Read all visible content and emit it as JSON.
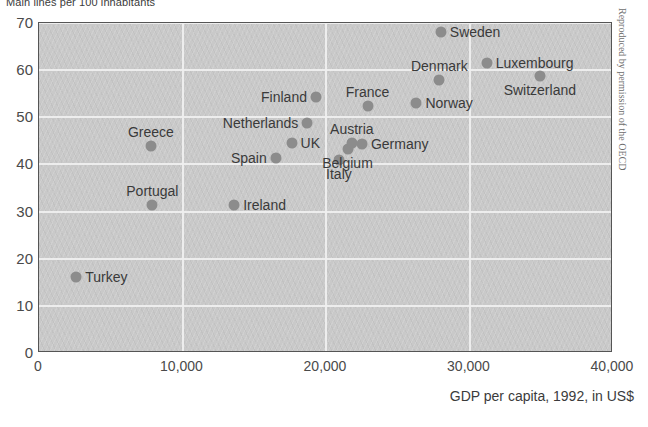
{
  "chart_data": {
    "type": "scatter",
    "title": "Main lines per 100 inhabitants",
    "xlabel": "GDP per capita, 1992, in US$",
    "ylabel": "Main lines per 100 inhabitants",
    "xlim": [
      0,
      40000
    ],
    "ylim": [
      0,
      70
    ],
    "xticks": [
      "0",
      "10,000",
      "20,000",
      "30,000",
      "40,000"
    ],
    "xtick_values": [
      0,
      10000,
      20000,
      30000,
      40000
    ],
    "yticks": [
      "0",
      "10",
      "20",
      "30",
      "40",
      "50",
      "60",
      "70"
    ],
    "ytick_values": [
      0,
      10,
      20,
      30,
      40,
      50,
      60,
      70
    ],
    "grid": true,
    "legend": null,
    "marker_color": "#8c8c8c",
    "plot_background": "#c9c9c9",
    "points": [
      {
        "name": "Turkey",
        "x": 2600,
        "y": 16.2,
        "label_pos": "r"
      },
      {
        "name": "Portugal",
        "x": 7900,
        "y": 31.5,
        "label_pos": "above"
      },
      {
        "name": "Greece",
        "x": 7800,
        "y": 44.0,
        "label_pos": "above"
      },
      {
        "name": "Ireland",
        "x": 13600,
        "y": 31.5,
        "label_pos": "r"
      },
      {
        "name": "Spain",
        "x": 16500,
        "y": 41.3,
        "label_pos": "l"
      },
      {
        "name": "UK",
        "x": 17600,
        "y": 44.5,
        "label_pos": "r"
      },
      {
        "name": "Netherlands",
        "x": 18700,
        "y": 48.8,
        "label_pos": "l"
      },
      {
        "name": "Finland",
        "x": 19300,
        "y": 54.2,
        "label_pos": "l"
      },
      {
        "name": "Italy",
        "x": 20900,
        "y": 41.0,
        "label_pos": "below"
      },
      {
        "name": "Belgium",
        "x": 21500,
        "y": 43.2,
        "label_pos": "below"
      },
      {
        "name": "Austria",
        "x": 21800,
        "y": 44.5,
        "label_pos": "above"
      },
      {
        "name": "France",
        "x": 22900,
        "y": 52.5,
        "label_pos": "above"
      },
      {
        "name": "Germany",
        "x": 22500,
        "y": 44.3,
        "label_pos": "r"
      },
      {
        "name": "Norway",
        "x": 26300,
        "y": 53.0,
        "label_pos": "r"
      },
      {
        "name": "Denmark",
        "x": 27900,
        "y": 58.0,
        "label_pos": "above"
      },
      {
        "name": "Sweden",
        "x": 28000,
        "y": 68.0,
        "label_pos": "r"
      },
      {
        "name": "Luxembourg",
        "x": 31200,
        "y": 61.5,
        "label_pos": "r"
      },
      {
        "name": "Switzerland",
        "x": 34900,
        "y": 58.8,
        "label_pos": "below"
      }
    ]
  },
  "credit": "Reproduced by permission of the OECD"
}
